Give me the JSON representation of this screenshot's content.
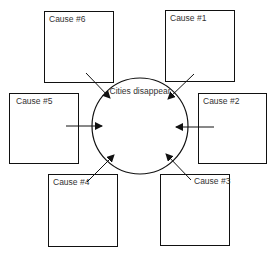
{
  "center": {
    "label": "Cities disappear"
  },
  "causes": [
    {
      "label": "Cause #1"
    },
    {
      "label": "Cause #2"
    },
    {
      "label": "Cause #3"
    },
    {
      "label": "Cause #4"
    },
    {
      "label": "Cause #5"
    },
    {
      "label": "Cause #6"
    }
  ],
  "colors": {
    "stroke": "#111111",
    "text": "#333333",
    "background": "#ffffff"
  }
}
